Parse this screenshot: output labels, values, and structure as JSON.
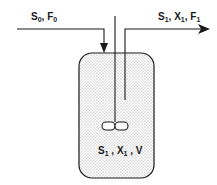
{
  "diagram": {
    "type": "continuous stirred tank reactor (chemostat)",
    "colors": {
      "stroke": "#1a1a1a",
      "fill_dots": "#9a9a9a",
      "background": "#ffffff"
    },
    "inlet": {
      "label": {
        "s": "S",
        "s_sub": "0",
        "sep": ", ",
        "f": "F",
        "f_sub": "0"
      }
    },
    "outlet": {
      "label": {
        "s": "S",
        "s_sub": "1",
        "sep1": ", ",
        "x": "X",
        "x_sub": "1",
        "sep2": ", ",
        "f": "F",
        "f_sub": "1"
      }
    },
    "tank": {
      "label": {
        "s": "S",
        "s_sub": "1",
        "sep1": " , ",
        "x": "X",
        "x_sub": "1",
        "sep2": " , ",
        "v": "V"
      }
    },
    "agitator": {
      "blades": 2
    }
  }
}
